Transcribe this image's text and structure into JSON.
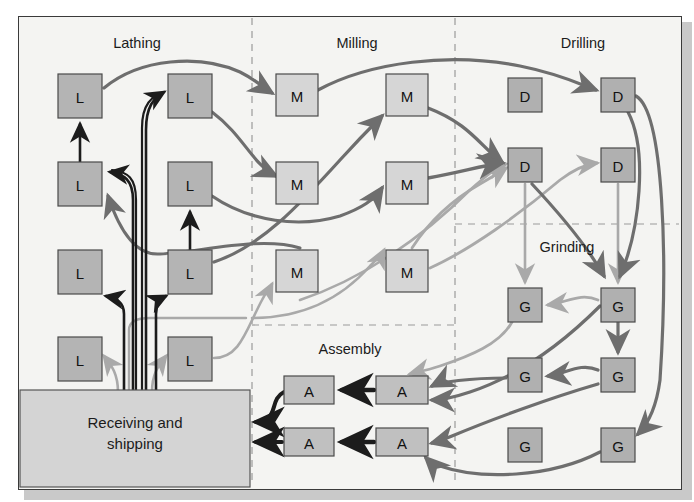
{
  "figure": {
    "kind": "process-layout-flow-diagram",
    "title_visible": false,
    "background": "#f4f4f2",
    "border_color": "#3a3a3a"
  },
  "departments": [
    {
      "id": "lathing",
      "label": "Lathing",
      "label_x": 137,
      "label_y": 48,
      "machine_code": "L"
    },
    {
      "id": "milling",
      "label": "Milling",
      "label_y": 48,
      "label_x": 357,
      "machine_code": "M"
    },
    {
      "id": "drilling",
      "label": "Drilling",
      "label_x": 583,
      "label_y": 48,
      "machine_code": "D"
    },
    {
      "id": "grinding",
      "label": "Grinding",
      "label_x": 567,
      "label_y": 252,
      "machine_code": "G"
    },
    {
      "id": "assembly",
      "label": "Assembly",
      "label_x": 350,
      "label_y": 354,
      "machine_code": "A"
    }
  ],
  "receiving_block": {
    "line1": "Receiving and",
    "line2": "shipping",
    "x": 20,
    "y": 390,
    "w": 230,
    "h": 97,
    "fill": "#d4d4d4",
    "stroke": "#555555"
  },
  "colors": {
    "machine_lathe_fill": "#b4b4b4",
    "machine_mill_fill": "#d6d6d6",
    "machine_drill_fill": "#b0b0b0",
    "machine_grind_fill": "#b0b0b0",
    "machine_assembly_fill": "#c0c0c0",
    "machine_stroke": "#4a4a4a",
    "flow_dark": "#1c1c1c",
    "flow_mid": "#6e6e6e",
    "flow_light": "#a9a9a9",
    "divider": "#9a9a9a",
    "page_background": "#ffffff"
  },
  "machines": [
    {
      "id": "L1",
      "label": "L",
      "dept": "lathing",
      "x": 58,
      "y": 74,
      "w": 44,
      "h": 44,
      "fill": "#b4b4b4"
    },
    {
      "id": "L2",
      "label": "L",
      "dept": "lathing",
      "x": 168,
      "y": 74,
      "w": 44,
      "h": 44,
      "fill": "#b4b4b4"
    },
    {
      "id": "L3",
      "label": "L",
      "dept": "lathing",
      "x": 58,
      "y": 162,
      "w": 44,
      "h": 44,
      "fill": "#b4b4b4"
    },
    {
      "id": "L4",
      "label": "L",
      "dept": "lathing",
      "x": 168,
      "y": 162,
      "w": 44,
      "h": 44,
      "fill": "#b4b4b4"
    },
    {
      "id": "L5",
      "label": "L",
      "dept": "lathing",
      "x": 58,
      "y": 250,
      "w": 44,
      "h": 44,
      "fill": "#b4b4b4"
    },
    {
      "id": "L6",
      "label": "L",
      "dept": "lathing",
      "x": 168,
      "y": 250,
      "w": 44,
      "h": 44,
      "fill": "#b4b4b4"
    },
    {
      "id": "L7",
      "label": "L",
      "dept": "lathing",
      "x": 58,
      "y": 337,
      "w": 44,
      "h": 44,
      "fill": "#b4b4b4"
    },
    {
      "id": "L8",
      "label": "L",
      "dept": "lathing",
      "x": 168,
      "y": 337,
      "w": 44,
      "h": 44,
      "fill": "#b4b4b4"
    },
    {
      "id": "M1",
      "label": "M",
      "dept": "milling",
      "x": 276,
      "y": 74,
      "w": 42,
      "h": 42,
      "fill": "#d6d6d6"
    },
    {
      "id": "M2",
      "label": "M",
      "dept": "milling",
      "x": 386,
      "y": 74,
      "w": 42,
      "h": 42,
      "fill": "#d6d6d6"
    },
    {
      "id": "M3",
      "label": "M",
      "dept": "milling",
      "x": 276,
      "y": 162,
      "w": 42,
      "h": 42,
      "fill": "#d6d6d6"
    },
    {
      "id": "M4",
      "label": "M",
      "dept": "milling",
      "x": 386,
      "y": 162,
      "w": 42,
      "h": 42,
      "fill": "#d6d6d6"
    },
    {
      "id": "M5",
      "label": "M",
      "dept": "milling",
      "x": 276,
      "y": 250,
      "w": 42,
      "h": 42,
      "fill": "#d6d6d6"
    },
    {
      "id": "M6",
      "label": "M",
      "dept": "milling",
      "x": 386,
      "y": 250,
      "w": 42,
      "h": 42,
      "fill": "#d6d6d6"
    },
    {
      "id": "D1",
      "label": "D",
      "dept": "drilling",
      "x": 508,
      "y": 78,
      "w": 34,
      "h": 34,
      "fill": "#b0b0b0"
    },
    {
      "id": "D2",
      "label": "D",
      "dept": "drilling",
      "x": 601,
      "y": 78,
      "w": 34,
      "h": 34,
      "fill": "#b0b0b0"
    },
    {
      "id": "D3",
      "label": "D",
      "dept": "drilling",
      "x": 508,
      "y": 148,
      "w": 34,
      "h": 34,
      "fill": "#b0b0b0"
    },
    {
      "id": "D4",
      "label": "D",
      "dept": "drilling",
      "x": 601,
      "y": 148,
      "w": 34,
      "h": 34,
      "fill": "#b0b0b0"
    },
    {
      "id": "G1",
      "label": "G",
      "dept": "grinding",
      "x": 508,
      "y": 288,
      "w": 34,
      "h": 34,
      "fill": "#b0b0b0"
    },
    {
      "id": "G2",
      "label": "G",
      "dept": "grinding",
      "x": 601,
      "y": 288,
      "w": 34,
      "h": 34,
      "fill": "#b0b0b0"
    },
    {
      "id": "G3",
      "label": "G",
      "dept": "grinding",
      "x": 508,
      "y": 358,
      "w": 34,
      "h": 34,
      "fill": "#b0b0b0"
    },
    {
      "id": "G4",
      "label": "G",
      "dept": "grinding",
      "x": 601,
      "y": 358,
      "w": 34,
      "h": 34,
      "fill": "#b0b0b0"
    },
    {
      "id": "G5",
      "label": "G",
      "dept": "grinding",
      "x": 508,
      "y": 428,
      "w": 34,
      "h": 34,
      "fill": "#b0b0b0"
    },
    {
      "id": "G6",
      "label": "G",
      "dept": "grinding",
      "x": 601,
      "y": 428,
      "w": 34,
      "h": 34,
      "fill": "#b0b0b0"
    },
    {
      "id": "A1",
      "label": "A",
      "dept": "assembly",
      "x": 284,
      "y": 376,
      "w": 50,
      "h": 28,
      "fill": "#c0c0c0"
    },
    {
      "id": "A2",
      "label": "A",
      "dept": "assembly",
      "x": 376,
      "y": 376,
      "w": 52,
      "h": 28,
      "fill": "#c0c0c0"
    },
    {
      "id": "A3",
      "label": "A",
      "dept": "assembly",
      "x": 284,
      "y": 428,
      "w": 50,
      "h": 28,
      "fill": "#c0c0c0"
    },
    {
      "id": "A4",
      "label": "A",
      "dept": "assembly",
      "x": 376,
      "y": 428,
      "w": 52,
      "h": 28,
      "fill": "#c0c0c0"
    }
  ],
  "dividers": [
    {
      "id": "v1",
      "orientation": "vertical",
      "x": 252,
      "y1": 18,
      "y2": 486
    },
    {
      "id": "v2",
      "orientation": "vertical",
      "x": 455,
      "y1": 18,
      "y2": 486
    },
    {
      "id": "h1",
      "orientation": "horizontal",
      "y": 224,
      "x1": 455,
      "x2": 679
    },
    {
      "id": "h2",
      "orientation": "horizontal",
      "y": 325,
      "x1": 252,
      "x2": 455
    }
  ],
  "chart_data": {
    "type": "diagram",
    "legend_position": "none",
    "grid": false,
    "nodes": [
      "L1",
      "L2",
      "L3",
      "L4",
      "L5",
      "L6",
      "L7",
      "L8",
      "M1",
      "M2",
      "M3",
      "M4",
      "M5",
      "M6",
      "D1",
      "D2",
      "D3",
      "D4",
      "G1",
      "G2",
      "G3",
      "G4",
      "G5",
      "G6",
      "A1",
      "A2",
      "A3",
      "A4",
      "Receiving and shipping"
    ],
    "flows": [
      {
        "from": "Receiving and shipping",
        "to": "L2",
        "tone": "dark"
      },
      {
        "from": "Receiving and shipping",
        "to": "L3",
        "tone": "dark"
      },
      {
        "from": "Receiving and shipping",
        "to": "L5",
        "tone": "dark"
      },
      {
        "from": "Receiving and shipping",
        "to": "L6",
        "tone": "dark"
      },
      {
        "from": "Receiving and shipping",
        "to": "L7",
        "tone": "light"
      },
      {
        "from": "Receiving and shipping",
        "to": "L8",
        "tone": "light"
      },
      {
        "from": "L3",
        "to": "L1",
        "tone": "dark"
      },
      {
        "from": "L6",
        "to": "L4",
        "tone": "dark"
      },
      {
        "from": "L1",
        "to": "M1",
        "tone": "mid"
      },
      {
        "from": "L2",
        "to": "M3",
        "tone": "mid"
      },
      {
        "from": "L4",
        "to": "M4",
        "tone": "mid"
      },
      {
        "from": "L6",
        "to": "M2",
        "tone": "mid"
      },
      {
        "from": "L8",
        "to": "M5",
        "tone": "light"
      },
      {
        "from": "M1",
        "to": "D2",
        "tone": "mid"
      },
      {
        "from": "M2",
        "to": "D3",
        "tone": "mid"
      },
      {
        "from": "M4",
        "to": "D3",
        "tone": "mid"
      },
      {
        "from": "M6",
        "to": "D3",
        "tone": "light"
      },
      {
        "from": "D3",
        "to": "G1",
        "tone": "light"
      },
      {
        "from": "D4",
        "to": "G2",
        "tone": "light"
      },
      {
        "from": "D2",
        "to": "G2",
        "tone": "mid"
      },
      {
        "from": "G2",
        "to": "G1",
        "tone": "light"
      },
      {
        "from": "G2",
        "to": "G4",
        "tone": "mid"
      },
      {
        "from": "G4",
        "to": "G3",
        "tone": "mid"
      },
      {
        "from": "G1",
        "to": "A2",
        "tone": "light"
      },
      {
        "from": "G3",
        "to": "A2",
        "tone": "mid"
      },
      {
        "from": "G4",
        "to": "A4",
        "tone": "mid"
      },
      {
        "from": "G6",
        "to": "A4",
        "tone": "mid"
      },
      {
        "from": "A2",
        "to": "A1",
        "tone": "dark"
      },
      {
        "from": "A4",
        "to": "A3",
        "tone": "dark"
      },
      {
        "from": "A1",
        "to": "Receiving and shipping",
        "tone": "dark"
      },
      {
        "from": "A3",
        "to": "Receiving and shipping",
        "tone": "dark"
      },
      {
        "from": "D2",
        "to": "G6",
        "tone": "mid"
      },
      {
        "from": "M6",
        "to": "D4",
        "tone": "light"
      }
    ]
  }
}
